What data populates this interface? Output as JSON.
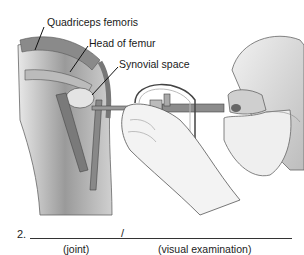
{
  "figure": {
    "labels": {
      "quadriceps": "Quadriceps femoris",
      "head_of_femur": "Head of femur",
      "synovial_space": "Synovial space"
    }
  },
  "exercise": {
    "number": "2.",
    "separator": "/",
    "hint_left": "(joint)",
    "hint_right": "(visual examination)"
  }
}
